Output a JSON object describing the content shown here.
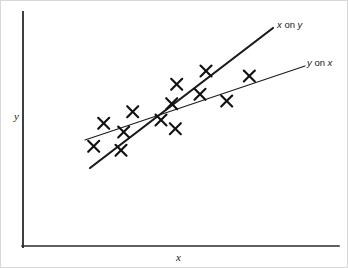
{
  "figure": {
    "background_color": "#ffffff",
    "width": 348,
    "height": 268
  },
  "axes": {
    "y_axis_label": "y",
    "x_axis_label": "x",
    "axis_color": "#2b2b2b",
    "y_axis": {
      "x": 22,
      "y_top": 11,
      "y_bottom": 246
    },
    "x_axis": {
      "y": 245,
      "x_left": 21,
      "x_right": 338
    }
  },
  "labels": {
    "x_on_y": {
      "var1": "x",
      "op": " on ",
      "var2": "y"
    },
    "y_on_x": {
      "var1": "y",
      "op": " on ",
      "var2": "x"
    }
  },
  "chart_data": {
    "type": "scatter",
    "title": "",
    "xlabel": "x",
    "ylabel": "y",
    "grid": false,
    "legend": "inline-line-labels",
    "axis_ticks": [],
    "note": "Scatter of crosses with two regression lines: 'x on y' (steep, thick) and 'y on x' (shallow, thin), crossing near the centroid.",
    "points": [
      {
        "x": 102.7,
        "y": 122.3
      },
      {
        "x": 92.7,
        "y": 145.3
      },
      {
        "x": 122.7,
        "y": 131.0
      },
      {
        "x": 120.0,
        "y": 149.3
      },
      {
        "x": 131.7,
        "y": 110.7
      },
      {
        "x": 160.0,
        "y": 119.0
      },
      {
        "x": 170.7,
        "y": 102.7
      },
      {
        "x": 175.7,
        "y": 83.3
      },
      {
        "x": 174.3,
        "y": 127.7
      },
      {
        "x": 199.0,
        "y": 93.3
      },
      {
        "x": 205.0,
        "y": 70.0
      },
      {
        "x": 225.7,
        "y": 100.0
      },
      {
        "x": 248.3,
        "y": 75.0
      }
    ],
    "point_count": 13,
    "marker": "x-cross",
    "marker_size": 11,
    "series": [
      {
        "name": "x on y",
        "kind": "line",
        "style": "thick",
        "stroke_width": 2.2,
        "x1": 89,
        "y1": 167,
        "x2": 272,
        "y2": 27
      },
      {
        "name": "y on x",
        "kind": "line",
        "style": "thin",
        "stroke_width": 1.1,
        "x1": 84,
        "y1": 139,
        "x2": 304,
        "y2": 65
      }
    ]
  }
}
